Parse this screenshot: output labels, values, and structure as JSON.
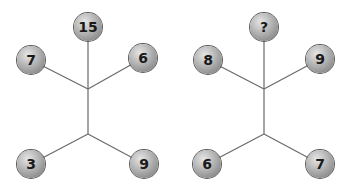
{
  "figures": [
    {
      "name": "figure-left",
      "balls": {
        "top": "15",
        "upper_left": "7",
        "upper_right": "6",
        "lower_left": "3",
        "lower_right": "9"
      }
    },
    {
      "name": "figure-right",
      "balls": {
        "top": "?",
        "upper_left": "8",
        "upper_right": "9",
        "lower_left": "6",
        "lower_right": "7"
      }
    }
  ],
  "colors": {
    "line": "#6a6a6a",
    "ball": "#a8a8a8",
    "text": "#1a1a1a"
  }
}
